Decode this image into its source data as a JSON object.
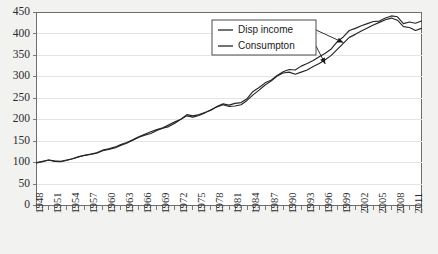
{
  "chart_data": {
    "type": "line",
    "title": "",
    "xlabel": "",
    "ylabel": "",
    "ylim": [
      0,
      450
    ],
    "ytick_step": 50,
    "yticks": [
      0,
      50,
      100,
      150,
      200,
      250,
      300,
      350,
      400,
      450
    ],
    "xlim": [
      1948,
      2012
    ],
    "xtick_step": 3,
    "xticks": [
      1948,
      1951,
      1954,
      1957,
      1960,
      1963,
      1966,
      1969,
      1972,
      1975,
      1978,
      1981,
      1984,
      1987,
      1990,
      1993,
      1996,
      1999,
      2002,
      2005,
      2008,
      2011
    ],
    "grid": true,
    "grid_axis": "y",
    "legend_position": "top-right-inside",
    "x": [
      1948,
      1949,
      1950,
      1951,
      1952,
      1953,
      1954,
      1955,
      1956,
      1957,
      1958,
      1959,
      1960,
      1961,
      1962,
      1963,
      1964,
      1965,
      1966,
      1967,
      1968,
      1969,
      1970,
      1971,
      1972,
      1973,
      1974,
      1975,
      1976,
      1977,
      1978,
      1979,
      1980,
      1981,
      1982,
      1983,
      1984,
      1985,
      1986,
      1987,
      1988,
      1989,
      1990,
      1991,
      1992,
      1993,
      1994,
      1995,
      1996,
      1997,
      1998,
      1999,
      2000,
      2001,
      2002,
      2003,
      2004,
      2005,
      2006,
      2007,
      2008,
      2009,
      2010,
      2011,
      2012
    ],
    "series": [
      {
        "name": "Disp income",
        "color": "#262626",
        "values": [
          100,
          103,
          106,
          104,
          103,
          106,
          109,
          113,
          117,
          120,
          123,
          129,
          132,
          136,
          142,
          147,
          153,
          160,
          166,
          172,
          177,
          181,
          188,
          195,
          201,
          212,
          209,
          212,
          217,
          222,
          231,
          237,
          234,
          238,
          240,
          249,
          266,
          275,
          286,
          292,
          303,
          312,
          317,
          316,
          325,
          331,
          338,
          347,
          355,
          365,
          382,
          393,
          408,
          413,
          419,
          424,
          429,
          430,
          437,
          442,
          440,
          424,
          428,
          425,
          430
        ]
      },
      {
        "name": "Consumpton",
        "color": "#262626",
        "values": [
          99,
          102,
          106,
          103,
          102,
          105,
          109,
          114,
          117,
          119,
          122,
          128,
          131,
          134,
          140,
          145,
          152,
          159,
          164,
          168,
          175,
          180,
          184,
          192,
          201,
          209,
          206,
          210,
          216,
          223,
          230,
          235,
          231,
          232,
          235,
          245,
          258,
          269,
          281,
          290,
          302,
          309,
          311,
          306,
          311,
          316,
          324,
          331,
          340,
          350,
          364,
          378,
          392,
          399,
          407,
          414,
          421,
          427,
          433,
          437,
          432,
          417,
          415,
          408,
          413
        ]
      }
    ],
    "annotations": [
      {
        "name": "leader-disp-income",
        "from_label": "Disp income",
        "to_x": 1999,
        "to_y": 380
      },
      {
        "name": "leader-consumption",
        "from_label": "Consumpton",
        "to_x": 1996,
        "to_y": 330
      }
    ]
  },
  "legend": {
    "entries": [
      {
        "label": "Disp income"
      },
      {
        "label": "Consumpton"
      }
    ]
  }
}
